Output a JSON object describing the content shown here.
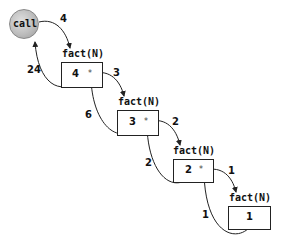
{
  "diagram": {
    "caller": {
      "label": "call",
      "icon": "call-circle",
      "color": "#bdbdbd"
    },
    "frames": [
      {
        "title": "fact(N)",
        "value": "4",
        "marker": "*",
        "arg_in": "4",
        "return_out": "24"
      },
      {
        "title": "fact(N)",
        "value": "3",
        "marker": "*",
        "arg_in": "3",
        "return_out": "6"
      },
      {
        "title": "fact(N)",
        "value": "2",
        "marker": "*",
        "arg_in": "2",
        "return_out": "2"
      },
      {
        "title": "fact(N)",
        "value": "1",
        "marker": "",
        "arg_in": "1",
        "return_out": "1"
      }
    ],
    "line_color": "#222222"
  }
}
